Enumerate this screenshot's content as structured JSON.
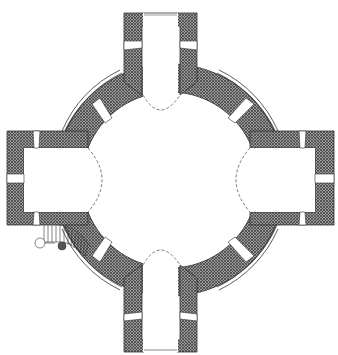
{
  "diagram": {
    "type": "architectural-floor-plan",
    "shape": "greek-cross with central circular hall",
    "colors": {
      "background": "#ffffff",
      "wall_hatch": "#555555",
      "wall_fill": "#8a8a8a",
      "line": "#333333",
      "dashed_arc": "#555555"
    },
    "elements": {
      "central_hall": "circular rotunda",
      "arms": [
        "north-arm",
        "east-arm",
        "south-arm",
        "west-arm"
      ],
      "openings_per_arm": 3,
      "diagonal_windows": 4,
      "staircase": "spiral staircase in south-west corner",
      "outer_ring": "thin curved plinth lines between arms",
      "apse_arcs": "dashed arcs marking vault boundaries at each arm entrance"
    }
  }
}
